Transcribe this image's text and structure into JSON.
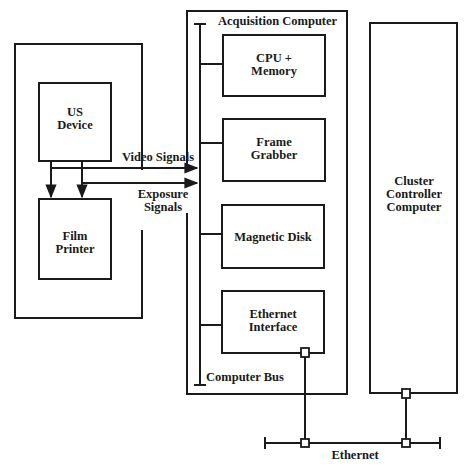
{
  "diagram": {
    "title": "",
    "nodes": {
      "us_device": {
        "label_line1": "US",
        "label_line2": "Device"
      },
      "film_printer": {
        "label_line1": "Film",
        "label_line2": "Printer"
      },
      "acquisition_computer": {
        "label": "Acquisition Computer"
      },
      "cpu_memory": {
        "label_line1": "CPU +",
        "label_line2": "Memory"
      },
      "frame_grabber": {
        "label_line1": "Frame",
        "label_line2": "Grabber"
      },
      "magnetic_disk": {
        "label": "Magnetic Disk"
      },
      "ethernet_interface": {
        "label_line1": "Ethernet",
        "label_line2": "Interface"
      },
      "computer_bus": {
        "label": "Computer Bus"
      },
      "cluster_controller": {
        "label_line1": "Cluster",
        "label_line2": "Controller",
        "label_line3": "Computer"
      },
      "ethernet": {
        "label": "Ethernet"
      }
    },
    "edges": {
      "video_signals": {
        "label": "Video Signals",
        "from": "US Device",
        "to": "Frame Grabber"
      },
      "exposure_signals": {
        "label_line1": "Exposure",
        "label_line2": "Signals",
        "from": "US Device",
        "to": "Acquisition Computer"
      },
      "us_to_film_1": {
        "from": "US Device",
        "to": "Film Printer"
      },
      "us_to_film_2": {
        "from": "US Device",
        "to": "Film Printer"
      },
      "ethernet_interface_link": {
        "from": "Ethernet Interface",
        "to": "Ethernet"
      },
      "cluster_link": {
        "from": "Cluster Controller Computer",
        "to": "Ethernet"
      }
    },
    "colors": {
      "stroke": "#1a1a1a",
      "background": "#ffffff"
    }
  }
}
